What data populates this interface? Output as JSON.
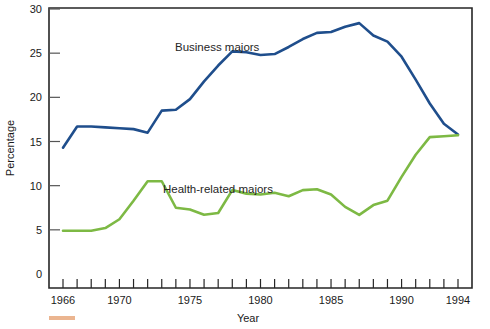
{
  "chart_data": {
    "type": "line",
    "title": "",
    "xlabel": "Year",
    "ylabel": "Percentage",
    "xlim": [
      1966,
      1994
    ],
    "ylim": [
      0,
      30
    ],
    "grid": false,
    "legend_position": "inline-annotations",
    "x": [
      1966,
      1967,
      1968,
      1969,
      1970,
      1971,
      1972,
      1973,
      1974,
      1975,
      1976,
      1977,
      1978,
      1979,
      1980,
      1981,
      1982,
      1983,
      1984,
      1985,
      1986,
      1987,
      1988,
      1989,
      1990,
      1991,
      1992,
      1993,
      1994
    ],
    "xticks": [
      1966,
      1970,
      1975,
      1980,
      1985,
      1990,
      1994
    ],
    "yticks": [
      0,
      5,
      10,
      15,
      20,
      25,
      30
    ],
    "series": [
      {
        "name": "Business majors",
        "color": "#1f4e8c",
        "values": [
          14.3,
          16.7,
          16.7,
          16.6,
          16.5,
          16.4,
          16.0,
          18.5,
          18.6,
          19.8,
          21.8,
          23.6,
          25.2,
          25.1,
          24.8,
          24.9,
          25.7,
          26.6,
          27.3,
          27.4,
          28.0,
          28.4,
          27.0,
          26.3,
          24.6,
          22.0,
          19.3,
          17.0,
          15.8
        ]
      },
      {
        "name": "Health-related majors",
        "color": "#7db944",
        "values": [
          4.9,
          4.9,
          4.9,
          5.2,
          6.2,
          8.3,
          10.5,
          10.5,
          7.5,
          7.3,
          6.7,
          6.9,
          9.5,
          9.1,
          9.0,
          9.2,
          8.8,
          9.5,
          9.6,
          9.0,
          7.6,
          6.7,
          7.8,
          8.3,
          11.0,
          13.5,
          15.5,
          15.6,
          15.7
        ]
      }
    ],
    "annotations": [
      {
        "text": "Business  majors",
        "x_px": 175,
        "y_px": 51
      },
      {
        "text": "Health-related majors",
        "x_px": 163,
        "y_px": 193
      }
    ]
  },
  "axes": {
    "y_title": "Percentage",
    "x_title": "Year",
    "y_tick_labels": [
      "0",
      "5",
      "10",
      "15",
      "20",
      "25",
      "30"
    ],
    "x_tick_labels": [
      "1966",
      "1970",
      "1975",
      "1980",
      "1985",
      "1990",
      "1994"
    ]
  },
  "colors": {
    "business": "#1f4e8c",
    "health": "#7db944",
    "axis": "#262626",
    "background": "#ffffff",
    "smudge": "#e8a87c"
  }
}
